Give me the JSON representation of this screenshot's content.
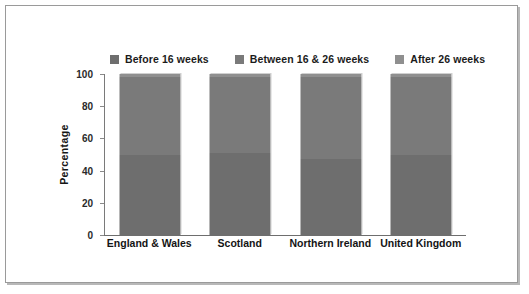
{
  "chart_data": {
    "type": "bar",
    "subtype": "stacked-100-percent",
    "title": "",
    "subtitle": "",
    "xlabel": "",
    "ylabel": "Percentage",
    "ylim": [
      0,
      100
    ],
    "yticks": [
      0,
      20,
      40,
      60,
      80,
      100
    ],
    "grid": false,
    "legend_position": "top",
    "orientation": "vertical",
    "categories": [
      "England & Wales",
      "Scotland",
      "Northern Ireland",
      "United Kingdom"
    ],
    "series": [
      {
        "name": "Before 16 weeks",
        "color": "#6e6e6e",
        "values": [
          50,
          51,
          47,
          50
        ]
      },
      {
        "name": "Between 16 & 26 weeks",
        "color": "#7a7a7a",
        "values": [
          48,
          47,
          51,
          48
        ]
      },
      {
        "name": "After 26 weeks",
        "color": "#8f8f8f",
        "values": [
          2,
          2,
          2,
          2
        ]
      }
    ]
  },
  "legend": {
    "items": [
      {
        "label": "Before 16 weeks",
        "color": "#6e6e6e",
        "icon": "legend-square-icon"
      },
      {
        "label": "Between 16 & 26 weeks",
        "color": "#7a7a7a",
        "icon": "legend-square-icon"
      },
      {
        "label": "After 26 weeks",
        "color": "#8f8f8f",
        "icon": "legend-square-icon"
      }
    ]
  },
  "axes": {
    "y_title": "Percentage",
    "y_tick_labels": [
      "0",
      "20",
      "40",
      "60",
      "80",
      "100"
    ],
    "x_tick_labels": [
      "England & Wales",
      "Scotland",
      "Northern Ireland",
      "United Kingdom"
    ]
  },
  "colors": {
    "frame_border": "#9a9a9a",
    "frame_shadow": "#b8b8b8",
    "axis": "#7a7a7a",
    "text": "#1b1b1b",
    "background": "#ffffff"
  }
}
